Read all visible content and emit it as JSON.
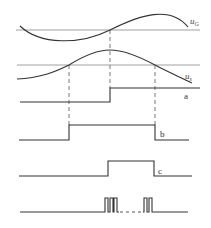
{
  "diagram": {
    "type": "timing-waveform",
    "colors": {
      "line": "#333333",
      "axis": "#777777",
      "dashed": "#555555",
      "background": "#ffffff"
    },
    "signals": [
      {
        "id": "uG",
        "label_main": "u",
        "label_sub": "G",
        "kind": "sine"
      },
      {
        "id": "us",
        "label_main": "u",
        "label_sub": "s",
        "kind": "sine"
      },
      {
        "id": "a",
        "label": "a",
        "kind": "step"
      },
      {
        "id": "b",
        "label": "b",
        "kind": "pulse"
      },
      {
        "id": "c",
        "label": "c",
        "kind": "pulse"
      },
      {
        "id": "pulses",
        "label": "",
        "kind": "pulse-train",
        "groups": [
          3,
          2
        ]
      }
    ],
    "dashed_markers_x": [
      69,
      110,
      155
    ]
  }
}
